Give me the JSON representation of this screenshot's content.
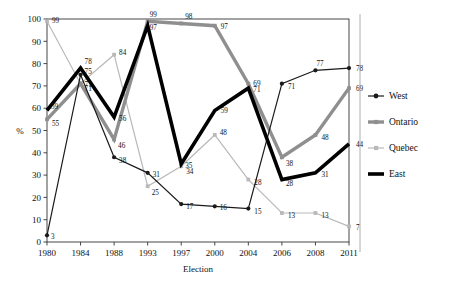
{
  "chart_data": {
    "type": "line",
    "title": "",
    "xlabel": "Election",
    "ylabel": "%",
    "ylim": [
      0,
      100
    ],
    "ytick_step": 10,
    "yticks": [
      0,
      10,
      20,
      30,
      40,
      50,
      60,
      70,
      80,
      90,
      100
    ],
    "categories": [
      "1980",
      "1984",
      "1988",
      "1993",
      "1997",
      "2000",
      "2004",
      "2006",
      "2008",
      "2011"
    ],
    "grid": false,
    "legend_position": "right",
    "series": [
      {
        "name": "West",
        "color": "#1a1a1a",
        "width": 1.2,
        "marker": "circle",
        "values": [
          3,
          75,
          38,
          31,
          17,
          16,
          15,
          71,
          77,
          78
        ],
        "labels": [
          "3",
          "75",
          "38",
          "31",
          "17",
          "16",
          "15",
          "71",
          "77",
          "78"
        ]
      },
      {
        "name": "Ontario",
        "color": "#8f8f8f",
        "width": 3.4,
        "marker": "square",
        "values": [
          55,
          71,
          46,
          99,
          98,
          97,
          71,
          38,
          48,
          69
        ],
        "labels": [
          "55",
          "71",
          "46",
          "99",
          "98",
          "97",
          "71",
          "38",
          "48",
          "69"
        ]
      },
      {
        "name": "Quebec",
        "color": "#b9b9b9",
        "width": 1.2,
        "marker": "square",
        "values": [
          99,
          71,
          84,
          25,
          34,
          48,
          28,
          13,
          13,
          7
        ],
        "labels": [
          "99",
          "71",
          "84",
          "25",
          "34",
          "48",
          "28",
          "13",
          "13",
          "7"
        ]
      },
      {
        "name": "East",
        "color": "#000000",
        "width": 3.6,
        "marker": "none",
        "values": [
          59,
          78,
          56,
          97,
          35,
          59,
          69,
          28,
          31,
          44
        ],
        "labels": [
          "59",
          "78",
          "56",
          "97",
          "35",
          "59",
          "69",
          "28",
          "31",
          "44"
        ]
      }
    ]
  },
  "legend": {
    "items": [
      {
        "label": "West"
      },
      {
        "label": "Ontario"
      },
      {
        "label": "Quebec"
      },
      {
        "label": "East"
      }
    ]
  }
}
